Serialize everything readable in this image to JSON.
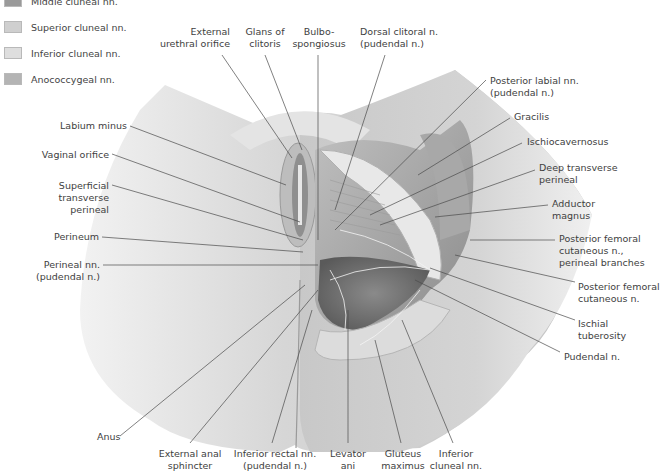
{
  "legend": {
    "items": [
      {
        "label": "Middle cluneal nn.",
        "color": "#9a9a9a"
      },
      {
        "label": "Superior cluneal nn.",
        "color": "#cfcfcf"
      },
      {
        "label": "Inferior cluneal nn.",
        "color": "#dedede"
      },
      {
        "label": "Anococcygeal nn.",
        "color": "#b4b4b4"
      }
    ]
  },
  "labels": {
    "top": {
      "external_urethral_orifice": [
        "External",
        "urethral orifice"
      ],
      "glans_of_clitoris": [
        "Glans of",
        "clitoris"
      ],
      "bulbospongiosus": [
        "Bulbo-",
        "spongiosus"
      ],
      "dorsal_clitoral_n": [
        "Dorsal clitoral n.",
        "(pudendal n.)"
      ]
    },
    "left": {
      "labium_minus": "Labium minus",
      "vaginal_orifice": "Vaginal orifice",
      "superficial_transverse_perineal": [
        "Superficial",
        "transverse",
        "perineal"
      ],
      "perineum": "Perineum",
      "perineal_nn": [
        "Perineal nn.",
        "(pudendal n.)"
      ]
    },
    "right": {
      "posterior_labial_nn": [
        "Posterior labial nn.",
        "(pudendal n.)"
      ],
      "gracilis": "Gracilis",
      "ischiocavernosus": "Ischiocavernosus",
      "deep_transverse_perineal": [
        "Deep transverse",
        "perineal"
      ],
      "adductor_magnus": [
        "Adductor",
        "magnus"
      ],
      "posterior_femoral_cutaneous_perineal": [
        "Posterior femoral",
        "cutaneous n.,",
        "perineal branches"
      ],
      "posterior_femoral_cutaneous": [
        "Posterior femoral",
        "cutaneous n."
      ],
      "ischial_tuberosity": [
        "Ischial",
        "tuberosity"
      ],
      "pudendal_n": "Pudendal n."
    },
    "bottom": {
      "anus": "Anus",
      "external_anal_sphincter": [
        "External anal",
        "sphincter"
      ],
      "inferior_rectal_nn": [
        "Inferior rectal nn.",
        "(pudendal n.)"
      ],
      "levator_ani": [
        "Levator",
        "ani"
      ],
      "gluteus_maximus": [
        "Gluteus",
        "maximus"
      ],
      "inferior_cluneal_nn": [
        "Inferior",
        "cluneal nn."
      ]
    }
  }
}
